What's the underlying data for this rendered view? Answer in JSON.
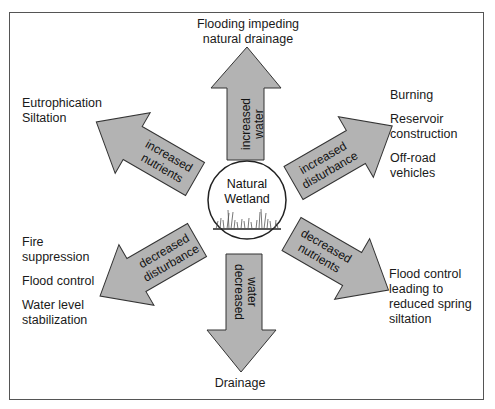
{
  "center": {
    "line1": "Natural",
    "line2": "Wetland"
  },
  "arrows": {
    "up": {
      "line1": "increased",
      "line2": "water"
    },
    "down": {
      "line1": "decreased",
      "line2": "water"
    },
    "upper_left": {
      "line1": "increased",
      "line2": "nutrients"
    },
    "upper_right": {
      "line1": "increased",
      "line2": "disturbance"
    },
    "lower_left": {
      "line1": "decreased",
      "line2": "disturbance"
    },
    "lower_right": {
      "line1": "decreased",
      "line2": "nutrients"
    }
  },
  "outcomes": {
    "top": {
      "line1": "Flooding impeding",
      "line2": "natural drainage"
    },
    "bottom": {
      "line1": "Drainage"
    },
    "upper_left": {
      "items": [
        "Eutrophication",
        "Siltation"
      ]
    },
    "upper_right": {
      "items": [
        "Burning",
        "Reservoir",
        "construction",
        "Off-road",
        "vehicles"
      ]
    },
    "lower_left": {
      "items": [
        "Fire",
        "suppression",
        "Flood control",
        "Water level",
        "stabilization"
      ]
    },
    "lower_right": {
      "items": [
        "Flood control",
        "leading to",
        "reduced spring",
        "siltation"
      ]
    }
  },
  "colors": {
    "arrow_fill": "#b3b3b3",
    "arrow_stroke": "#333333",
    "frame": "#555555"
  }
}
